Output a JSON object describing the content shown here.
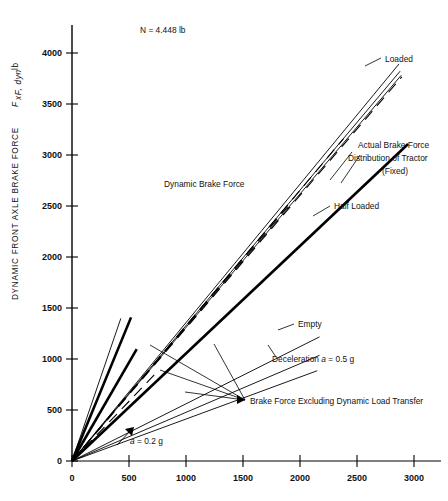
{
  "chart_data": {
    "type": "line",
    "title": "",
    "xlabel": "",
    "ylabel": "DYNAMIC FRONT AXLE BRAKE FORCE",
    "ylabel_symbol": "F",
    "ylabel_sub": "xF, dyn",
    "ylabel_unit": ", lb",
    "xlim": [
      0,
      3250
    ],
    "ylim": [
      0,
      4250
    ],
    "xticks": [
      0,
      500,
      1000,
      1500,
      2000,
      2500,
      3000
    ],
    "yticks": [
      0,
      500,
      1000,
      1500,
      2000,
      2500,
      3000,
      3500,
      4000
    ],
    "xtick_labels": [
      "0",
      "500",
      "1000",
      "1500",
      "2000",
      "2500",
      "3000"
    ],
    "ytick_labels": [
      "0",
      "500",
      "1000",
      "1500",
      "2000",
      "2500",
      "3000",
      "3500",
      "4000"
    ],
    "grid": false,
    "legend_position": "none",
    "unit_note": "N = 4.448 lb",
    "series": [
      {
        "name": "Dynamic Brake Force Loaded",
        "style": "solid-thin",
        "points": [
          [
            0,
            0
          ],
          [
            2880,
            3870
          ]
        ]
      },
      {
        "name": "Dynamic Brake Force Half Loaded",
        "style": "solid-thin",
        "points": [
          [
            0,
            0
          ],
          [
            2890,
            3800
          ]
        ]
      },
      {
        "name": "Dynamic Brake Force Empty",
        "style": "solid-thin",
        "points": [
          [
            0,
            0
          ],
          [
            2900,
            3760
          ]
        ]
      },
      {
        "name": "Brake Force Excluding Dynamic Load Transfer Loaded",
        "style": "dashed",
        "points": [
          [
            0,
            0
          ],
          [
            2905,
            3745
          ]
        ]
      },
      {
        "name": "Brake Force Excluding Dynamic Load Transfer Half Loaded",
        "style": "dashed",
        "points": [
          [
            0,
            0
          ],
          [
            2390,
            3140
          ]
        ]
      },
      {
        "name": "Brake Force Excluding Dynamic Load Transfer Empty",
        "style": "dashed",
        "points": [
          [
            0,
            0
          ],
          [
            1900,
            2480
          ]
        ]
      },
      {
        "name": "Actual Brake Force Distribution of Tractor (Fixed)",
        "style": "solid-thick",
        "points": [
          [
            0,
            0
          ],
          [
            2960,
            3090
          ]
        ]
      },
      {
        "name": "Deceleration a = 0.5 g limit line",
        "style": "solid-thin",
        "points": [
          [
            0,
            0
          ],
          [
            2180,
            1210
          ]
        ]
      },
      {
        "name": "Deceleration a = 0.5 g lower",
        "style": "solid-thin",
        "points": [
          [
            0,
            0
          ],
          [
            2180,
            1030
          ]
        ]
      },
      {
        "name": "Deceleration a = 0.5 g lowest",
        "style": "solid-thin",
        "points": [
          [
            0,
            0
          ],
          [
            2160,
            880
          ]
        ]
      },
      {
        "name": "a = 0.2 g limit thick",
        "style": "solid-thick",
        "points": [
          [
            0,
            0
          ],
          [
            570,
            1090
          ]
        ]
      },
      {
        "name": "a = 0.2 g limit thin",
        "style": "solid-thick",
        "points": [
          [
            0,
            0
          ],
          [
            520,
            1400
          ]
        ]
      },
      {
        "name": "a = 0.2 g dashed short",
        "style": "dashed",
        "points": [
          [
            0,
            0
          ],
          [
            760,
            880
          ]
        ]
      },
      {
        "name": "Steep reference line",
        "style": "solid-thin",
        "points": [
          [
            0,
            0
          ],
          [
            430,
            1390
          ]
        ]
      }
    ],
    "annotations": [
      {
        "key": "unit_note",
        "text": "N = 4.448 lb",
        "x": 700,
        "y": 4080
      },
      {
        "key": "loaded",
        "text": "Loaded",
        "x": 3000,
        "y": 3810
      },
      {
        "key": "dynamic_brake_force",
        "text": "Dynamic Brake Force",
        "x": 1020,
        "y": 2600
      },
      {
        "key": "actual_line1",
        "text": "Actual Brake Force",
        "x": 2720,
        "y": 3100
      },
      {
        "key": "actual_line2",
        "text": "Distribution of Tractor",
        "x": 2720,
        "y": 2960
      },
      {
        "key": "actual_line3",
        "text": "(Fixed)",
        "x": 2720,
        "y": 2820
      },
      {
        "key": "half_loaded",
        "text": "Half Loaded",
        "x": 2580,
        "y": 2400
      },
      {
        "key": "empty",
        "text": "Empty",
        "x": 2480,
        "y": 1260
      },
      {
        "key": "deceleration",
        "text": "Deceleration a = 0.5 g",
        "x": 2180,
        "y": 985
      },
      {
        "key": "excluding",
        "text": "Brake Force Excluding Dynamic Load Transfer",
        "x": 1440,
        "y": 540
      },
      {
        "key": "a02g",
        "text": "a = 0.2 g",
        "x": 740,
        "y": 250
      }
    ]
  },
  "axis": {
    "y_title_main": "DYNAMIC FRONT AXLE BRAKE FORCE",
    "y_title_symbol": "F",
    "y_title_sub": "xF, dyn",
    "y_title_unit": ", lb"
  },
  "annotations": {
    "unit_note": "N = 4.448 lb",
    "loaded": "Loaded",
    "dynamic_brake_force": "Dynamic Brake Force",
    "actual_line1": "Actual Brake Force",
    "actual_line2": "Distribution of Tractor",
    "actual_line3": "(Fixed)",
    "half_loaded": "Half Loaded",
    "empty": "Empty",
    "deceleration_pre": "Deceleration ",
    "deceleration_var": "a",
    "deceleration_post": " = 0.5 g",
    "excluding": "Brake Force Excluding Dynamic Load Transfer",
    "a02_var": "a",
    "a02_post": " = 0.2 g"
  }
}
